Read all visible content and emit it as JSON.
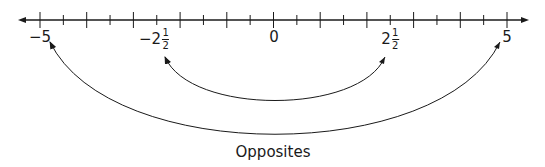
{
  "number_line": {
    "min": -5,
    "max": 5,
    "tick_step": 0.5,
    "labels": [
      {
        "value": -5,
        "text": "−5"
      },
      {
        "value": -2.5,
        "whole": "−2",
        "num": "1",
        "den": "2"
      },
      {
        "value": 0,
        "text": "0"
      },
      {
        "value": 2.5,
        "whole": "2",
        "num": "1",
        "den": "2"
      },
      {
        "value": 5,
        "text": "5"
      }
    ]
  },
  "arcs": [
    {
      "from": -2.5,
      "to": 2.5,
      "name": "inner-arc"
    },
    {
      "from": -5,
      "to": 5,
      "name": "outer-arc"
    }
  ],
  "caption": "Opposites",
  "colors": {
    "line": "#1a1a1a",
    "background": "#ffffff"
  }
}
